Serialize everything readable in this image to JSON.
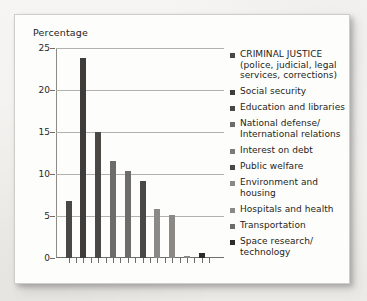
{
  "figure": {
    "axis_title": "Percentage"
  },
  "chart_data": {
    "type": "bar",
    "title": "",
    "xlabel": "",
    "ylabel": "Percentage",
    "ylim": [
      0,
      25
    ],
    "yticks": [
      0,
      5,
      10,
      15,
      20,
      25
    ],
    "grid": true,
    "legend_position": "right",
    "categories": [
      "CRIMINAL JUSTICE (police, judicial, legal services, corrections)",
      "Social security",
      "Education and libraries",
      "National defense/International relations",
      "Interest on debt",
      "Public welfare",
      "Environment and housing",
      "Hospitals and health",
      "Transportation",
      "Space research/technology"
    ],
    "values": [
      6.8,
      23.8,
      15.0,
      11.5,
      10.4,
      9.2,
      5.8,
      5.1,
      0.2,
      0.6
    ],
    "bar_colors": [
      "#4a4845",
      "#3f3d3a",
      "#4a4845",
      "#6e6c68",
      "#6e6c68",
      "#4a4845",
      "#8b8985",
      "#8b8985",
      "#8b8985",
      "#2e2c29"
    ]
  },
  "legend": {
    "items": [
      {
        "label": "CRIMINAL JUSTICE\n(police, judicial, legal\nservices, corrections)",
        "swatch": "#4a4845"
      },
      {
        "label": "Social security",
        "swatch": "#3f3d3a"
      },
      {
        "label": "Education and libraries",
        "swatch": "#4a4845"
      },
      {
        "label": "National defense/\nInternational relations",
        "swatch": "#6e6c68"
      },
      {
        "label": "Interest on debt",
        "swatch": "#7d7b77"
      },
      {
        "label": "Public welfare",
        "swatch": "#4a4845"
      },
      {
        "label": "Environment and\nhousing",
        "swatch": "#8b8985"
      },
      {
        "label": "Hospitals and health",
        "swatch": "#8b8985"
      },
      {
        "label": "Transportation",
        "swatch": "#6e6c68"
      },
      {
        "label": "Space research/\ntechnology",
        "swatch": "#2e2c29"
      }
    ]
  }
}
